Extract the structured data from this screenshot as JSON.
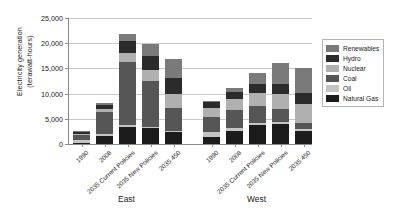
{
  "chart_data": {
    "type": "bar",
    "stacked": true,
    "title": "",
    "xlabel": "",
    "ylabel": "Electricity generation\n(terawatt-hours)",
    "ylim": [
      0,
      25000
    ],
    "ytick_labels": [
      "0",
      "5,000",
      "10,000",
      "15,000",
      "20,000",
      "25,000"
    ],
    "ytick_values": [
      0,
      5000,
      10000,
      15000,
      20000,
      25000
    ],
    "grid": true,
    "legend_position": "right",
    "groups": [
      "East",
      "West"
    ],
    "categories": [
      "1990",
      "2008",
      "2035 Current Policies",
      "2035 New Policies",
      "2035 450"
    ],
    "series": [
      {
        "name": "Natural Gas",
        "color": "#1c1c1c",
        "values_east": [
          300,
          1500,
          3300,
          3100,
          2400
        ],
        "values_west": [
          1400,
          2600,
          3800,
          3900,
          2600
        ]
      },
      {
        "name": "Oil",
        "color": "#c4c4c4",
        "values_east": [
          450,
          500,
          400,
          350,
          250
        ],
        "values_west": [
          900,
          600,
          450,
          400,
          300
        ]
      },
      {
        "name": "Coal",
        "color": "#565656",
        "values_east": [
          1100,
          4300,
          12600,
          9100,
          4400
        ],
        "values_west": [
          3000,
          3600,
          3300,
          2600,
          1300
        ]
      },
      {
        "name": "Nuclear",
        "color": "#b0b0b0",
        "values_east": [
          150,
          600,
          1700,
          2200,
          2900
        ],
        "values_west": [
          1800,
          2100,
          2500,
          3000,
          3700
        ]
      },
      {
        "name": "Hydro",
        "color": "#2b2b2b",
        "values_east": [
          350,
          900,
          2400,
          2700,
          3100
        ],
        "values_west": [
          1200,
          1500,
          1800,
          2000,
          2200
        ]
      },
      {
        "name": "Renewables",
        "color": "#7a7a7a",
        "values_east": [
          150,
          400,
          1400,
          2350,
          3750
        ],
        "values_west": [
          200,
          700,
          2150,
          4100,
          4900
        ]
      }
    ]
  },
  "legend": {
    "items": [
      {
        "label": "Renewables"
      },
      {
        "label": "Hydro"
      },
      {
        "label": "Nuclear"
      },
      {
        "label": "Coal"
      },
      {
        "label": "Oil"
      },
      {
        "label": "Natural Gas"
      }
    ]
  }
}
